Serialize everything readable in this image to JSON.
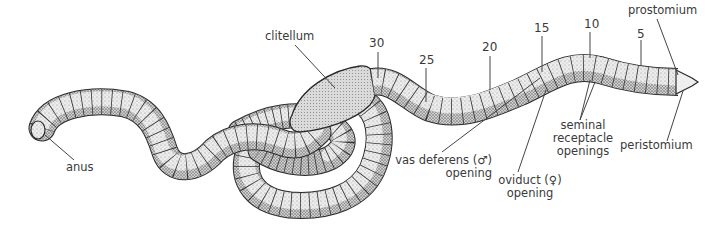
{
  "diagram": {
    "labels": {
      "clitellum": "clitellum",
      "anus": "anus",
      "prostomium": "prostomium",
      "peristomium": "peristomium",
      "seminal_line1": "seminal",
      "seminal_line2": "receptacle",
      "seminal_line3": "openings",
      "vas_line1": "vas deferens (♂)",
      "vas_line2": "opening",
      "oviduct_line1": "oviduct (♀)",
      "oviduct_line2": "opening"
    },
    "segment_numbers": {
      "s30": "30",
      "s25": "25",
      "s20": "20",
      "s15": "15",
      "s10": "10",
      "s5": "5"
    },
    "colors": {
      "outline": "#2a2a2a",
      "body_fill": "#e6e6e6",
      "shade": "#9a9a9a",
      "clitellum_fill": "#d0d0d0",
      "text": "#3a3a3a",
      "leader": "#444444"
    }
  }
}
